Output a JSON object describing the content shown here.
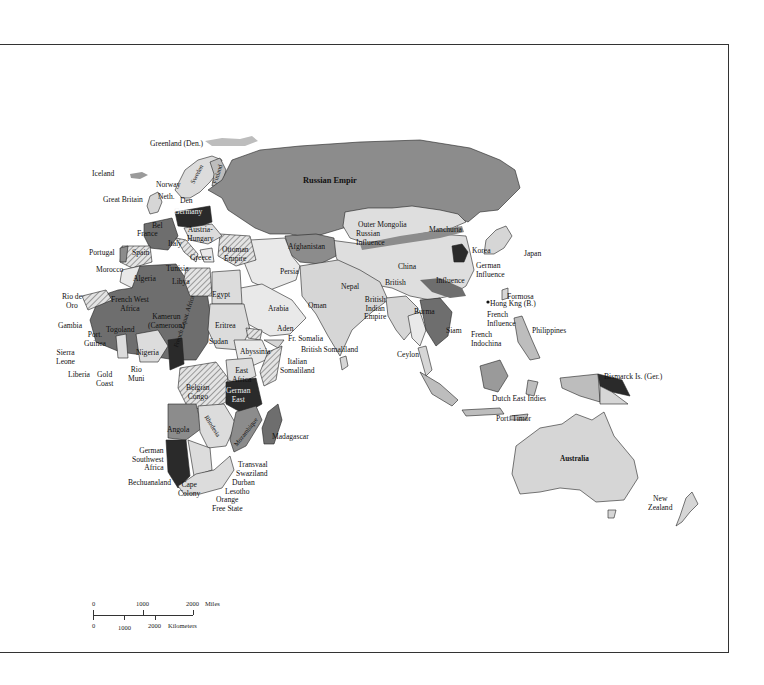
{
  "map": {
    "title": "Imperialism in Africa, Asia and the Pacific",
    "colors": {
      "russian": "#8c8c8c",
      "british": "#d6d6d6",
      "french": "#6e6e6e",
      "german": "#2a2a2a",
      "other_hatched": "#bdbdbd",
      "independent": "#e9e9e9",
      "water": "#ffffff",
      "border": "#222222"
    },
    "labels": {
      "greenland": "Greenland\n(Den.)",
      "iceland": "Iceland",
      "norway": "Norway",
      "sweden": "Sweden",
      "finland": "Finland",
      "great_britain": "Great Britain",
      "neth": "Neth.",
      "den": "Den",
      "germany": "Germany",
      "bel": "Bel",
      "france": "France",
      "austria_hungary": "Austria-\nHungary",
      "italy": "Italy",
      "portugal": "Portugal",
      "spain": "Spain",
      "greece": "Greece",
      "ottoman_empire": "Ottoman\nEmpire",
      "russian_empire": "Russian Empir",
      "outer_mongolia": "Outer Mongolia",
      "russian_influence": "Russian\nInfluence",
      "manchuria": "Manchuria",
      "korea": "Korea",
      "japan": "Japan",
      "german_influence": "German\nInfluence",
      "afghanistan": "Afghanistan",
      "persia": "Persia",
      "china": "China",
      "british_china": "British",
      "influence_china": "Influence",
      "nepal": "Nepal",
      "british_indian_empire": "British\nIndian\nEmpire",
      "formosa": "Formosa",
      "hong_kong": "Hong Kng (B.)",
      "french_influence": "French\nInfluence",
      "burma": "Burma",
      "siam": "Siam",
      "french_indochina": "French\nIndochina",
      "philippines": "Philippines",
      "morocco": "Morocco",
      "tunisia": "Tunisia",
      "algeria": "Algeria",
      "libya": "Libya",
      "egypt": "Egypt",
      "arabia": "Arabia",
      "oman": "Oman",
      "aden": "Aden",
      "rio_de_oro": "Rio de\nOro",
      "french_west_africa": "French West\nAfrica",
      "kamerun": "Kamerun\n(Cameroon)",
      "eritrea": "Eritrea",
      "sudan": "Sudan",
      "fr_somalia": "Fr. Somalia",
      "british_somaliland": "British Somaliland",
      "gambia": "Gambia",
      "port_guinea": "Port.\nGuinea",
      "togoland": "Togoland",
      "nigeria": "Nigeria",
      "abyssinia": "Abyssinia",
      "italian_somaliland": "Italian\nSomaliland",
      "ceylon": "Ceylon",
      "sierra_leone": "Sierra\nLeone",
      "liberia": "Liberia",
      "gold_coast": "Gold\nCoast",
      "rio_muni": "Rio\nMuni",
      "french_equatorial_africa": "French Equat. Africa",
      "belgian_congo": "Belgian\nCongo",
      "east_africa": "East\nAfrica",
      "german_east": "German\nEast",
      "angola": "Angola",
      "rhodesia": "Rhodesia",
      "mozambique": "Mozambique",
      "madagascar": "Madagascar",
      "german_southwest_africa": "German\nSouthwest\nAfrica",
      "bechuanaland": "Bechuanaland",
      "transvaal": "Transvaal",
      "swaziland": "Swaziland",
      "durban": "Durban",
      "lesotho": "Lesotho",
      "cape_colony": "Cape\nColony",
      "orange_free_state": "Orange\nFree State",
      "dutch_east_indies": "Dutch East Indies",
      "port_timor": "Port. Timor",
      "bismarck": "Bismarck Is. (Ger.)",
      "australia": "Australia",
      "new_zealand": "New\nZealand"
    },
    "scale_bar": {
      "miles_ticks": [
        "0",
        "1000",
        "2000"
      ],
      "miles_unit": "Miles",
      "km_ticks": [
        "0",
        "1000",
        "2000"
      ],
      "km_unit": "Kilometers"
    }
  }
}
